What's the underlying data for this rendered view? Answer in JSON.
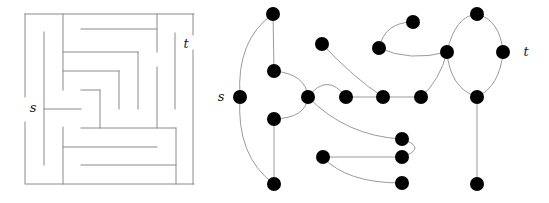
{
  "maze": {
    "labels": {
      "source": "s",
      "target": "t"
    },
    "label_positions": {
      "source": [
        33,
        112
      ],
      "target": [
        186,
        48
      ]
    },
    "walls": [
      [
        25,
        14,
        194,
        14
      ],
      [
        26,
        184,
        194,
        184
      ],
      [
        25,
        14,
        25,
        97
      ],
      [
        25,
        122,
        25,
        184
      ],
      [
        193,
        14,
        193,
        35
      ],
      [
        193,
        50,
        193,
        184
      ],
      [
        44,
        32,
        44,
        165
      ],
      [
        63,
        14,
        63,
        90
      ],
      [
        44,
        109,
        81,
        109
      ],
      [
        63,
        127,
        63,
        184
      ],
      [
        81,
        29,
        157,
        29
      ],
      [
        157,
        14,
        157,
        52
      ],
      [
        157,
        67,
        157,
        128
      ],
      [
        63,
        52,
        138,
        52
      ],
      [
        138,
        52,
        138,
        109
      ],
      [
        63,
        71,
        119,
        71
      ],
      [
        119,
        71,
        119,
        109
      ],
      [
        81,
        90,
        100,
        90
      ],
      [
        100,
        90,
        100,
        128
      ],
      [
        81,
        128,
        176,
        128
      ],
      [
        175,
        33,
        175,
        109
      ],
      [
        176,
        128,
        176,
        184
      ],
      [
        63,
        147,
        157,
        147
      ],
      [
        81,
        165,
        176,
        165
      ]
    ]
  },
  "graph": {
    "labels": {
      "source": "s",
      "target": "t"
    },
    "label_positions": {
      "source": [
        221,
        101
      ],
      "target": [
        526,
        56
      ]
    },
    "node_radius": 7,
    "nodes": {
      "A": [
        273,
        14
      ],
      "S0": [
        240,
        97
      ],
      "B": [
        274,
        71
      ],
      "C": [
        308,
        97
      ],
      "D": [
        274,
        119
      ],
      "E": [
        274,
        184
      ],
      "F": [
        322,
        44
      ],
      "G": [
        346,
        97
      ],
      "H": [
        383,
        97
      ],
      "H2": [
        421,
        97
      ],
      "I": [
        413,
        22
      ],
      "J": [
        379,
        48
      ],
      "K": [
        447,
        52
      ],
      "L": [
        477,
        14
      ],
      "M": [
        503,
        52
      ],
      "N": [
        477,
        97
      ],
      "T2": [
        477,
        184
      ],
      "O": [
        402,
        139
      ],
      "P": [
        402,
        157
      ],
      "Q": [
        323,
        157
      ],
      "R": [
        402,
        183
      ]
    },
    "edges": [
      {
        "d": "M273,14 Q236,40 240,97"
      },
      {
        "d": "M240,97 Q236,156 274,184"
      },
      {
        "d": "M273,14 L274,71"
      },
      {
        "d": "M274,71 Q306,74 308,97"
      },
      {
        "d": "M308,97 Q306,118 274,119"
      },
      {
        "d": "M274,119 L274,184"
      },
      {
        "d": "M308,97 Q327,72 346,97"
      },
      {
        "d": "M346,97 L421,97"
      },
      {
        "d": "M322,44 Q354,78 383,97"
      },
      {
        "d": "M421,97 Q440,80 447,52"
      },
      {
        "d": "M379,48 Q385,22 413,22"
      },
      {
        "d": "M379,48 Q410,62 447,52"
      },
      {
        "d": "M447,52 Q455,16 477,14"
      },
      {
        "d": "M477,14 Q500,20 503,52"
      },
      {
        "d": "M503,52 Q500,86 477,97"
      },
      {
        "d": "M477,97 Q450,88 447,52"
      },
      {
        "d": "M477,97 L477,184"
      },
      {
        "d": "M308,97 Q346,136 402,139"
      },
      {
        "d": "M402,139 Q428,148 402,157"
      },
      {
        "d": "M323,157 L402,157"
      },
      {
        "d": "M323,157 Q346,183 402,183"
      }
    ]
  }
}
